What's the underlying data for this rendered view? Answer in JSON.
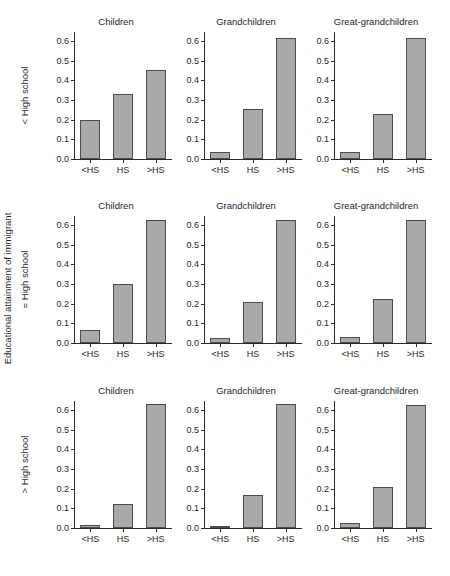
{
  "figure": {
    "outer_ylabel": "Educational attainment of immigrant",
    "top_cropped_text": "",
    "bar_color": "#a9a9a9",
    "bar_edge_color": "#4d4d4d",
    "axis_color": "#2b2b2b",
    "background": "#ffffff"
  },
  "axes": {
    "yticks": [
      "0.0",
      "0.1",
      "0.2",
      "0.3",
      "0.4",
      "0.5",
      "0.6"
    ],
    "ytick_values": [
      0.0,
      0.1,
      0.2,
      0.3,
      0.4,
      0.5,
      0.6
    ],
    "ylim": [
      0.0,
      0.645
    ],
    "xticks": [
      "<HS",
      "HS",
      ">HS"
    ]
  },
  "row_labels": [
    "< High school",
    "= High school",
    "> High school"
  ],
  "col_titles": [
    "Children",
    "Grandchildren",
    "Great-grandchildren"
  ],
  "chart_data": {
    "type": "bar",
    "title": "",
    "subtitle": "",
    "xlabel": "",
    "ylabel": "Educational attainment of immigrant",
    "ylim": [
      0.0,
      0.645
    ],
    "grid": false,
    "legend": "none",
    "layout": "3x3 small-multiples",
    "row_variable": "Educational attainment of immigrant",
    "col_variable": "Generation",
    "categories": [
      "<HS",
      "HS",
      ">HS"
    ],
    "panels": [
      {
        "row_label": "< High school",
        "col_title": "Children",
        "categories": [
          "<HS",
          "HS",
          ">HS"
        ],
        "values": [
          0.2,
          0.33,
          0.45
        ]
      },
      {
        "row_label": "< High school",
        "col_title": "Grandchildren",
        "categories": [
          "<HS",
          "HS",
          ">HS"
        ],
        "values": [
          0.035,
          0.255,
          0.615
        ]
      },
      {
        "row_label": "< High school",
        "col_title": "Great-grandchildren",
        "categories": [
          "<HS",
          "HS",
          ">HS"
        ],
        "values": [
          0.035,
          0.23,
          0.615
        ]
      },
      {
        "row_label": "= High school",
        "col_title": "Children",
        "categories": [
          "<HS",
          "HS",
          ">HS"
        ],
        "values": [
          0.065,
          0.3,
          0.625
        ]
      },
      {
        "row_label": "= High school",
        "col_title": "Grandchildren",
        "categories": [
          "<HS",
          "HS",
          ">HS"
        ],
        "values": [
          0.023,
          0.21,
          0.625
        ]
      },
      {
        "row_label": "= High school",
        "col_title": "Great-grandchildren",
        "categories": [
          "<HS",
          "HS",
          ">HS"
        ],
        "values": [
          0.032,
          0.225,
          0.625
        ]
      },
      {
        "row_label": "> High school",
        "col_title": "Children",
        "categories": [
          "<HS",
          "HS",
          ">HS"
        ],
        "values": [
          0.015,
          0.12,
          0.63
        ]
      },
      {
        "row_label": "> High school",
        "col_title": "Grandchildren",
        "categories": [
          "<HS",
          "HS",
          ">HS"
        ],
        "values": [
          0.012,
          0.17,
          0.63
        ]
      },
      {
        "row_label": "> High school",
        "col_title": "Great-grandchildren",
        "categories": [
          "<HS",
          "HS",
          ">HS"
        ],
        "values": [
          0.025,
          0.21,
          0.625
        ]
      }
    ]
  }
}
